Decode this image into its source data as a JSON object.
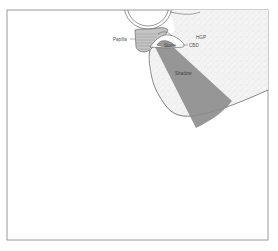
{
  "diagram": {
    "type": "anatomical-illustration",
    "labels": {
      "papilla": "Papilla",
      "hgp": "HGP",
      "cbd": "CBD",
      "stone": "Stone",
      "shadow": "Shadow"
    },
    "colors": {
      "frame": "#9a9a9a",
      "outline": "#555555",
      "texture": "#e6e6e6",
      "papilla_fill": "#bdbdbd",
      "shadow_fill": "#8c8c8c",
      "background": "#ffffff"
    }
  }
}
